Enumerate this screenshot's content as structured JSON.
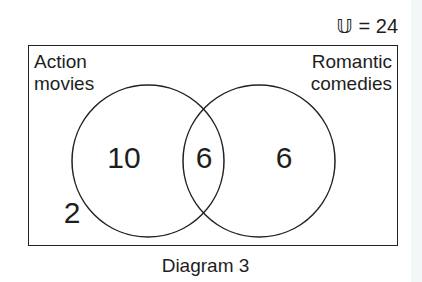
{
  "diagram": {
    "type": "venn",
    "universe": {
      "symbol": "𝕌",
      "label": "𝕌 = 24",
      "total": 24
    },
    "sets": [
      {
        "id": "A",
        "name": "Action movies",
        "label_lines": [
          "Action",
          "movies"
        ]
      },
      {
        "id": "B",
        "name": "Romantic comedies",
        "label_lines": [
          "Romantic",
          "comedies"
        ]
      }
    ],
    "regions": {
      "only_A": {
        "label": "10",
        "value": 10
      },
      "A_and_B": {
        "label": "6",
        "value": 6
      },
      "only_B": {
        "label": "6",
        "value": 6
      },
      "neither": {
        "label": "2",
        "value": 2
      }
    },
    "caption": "Diagram 3"
  },
  "colors": {
    "line": "#222222",
    "text": "#1e1e1e",
    "background": "#ffffff"
  }
}
